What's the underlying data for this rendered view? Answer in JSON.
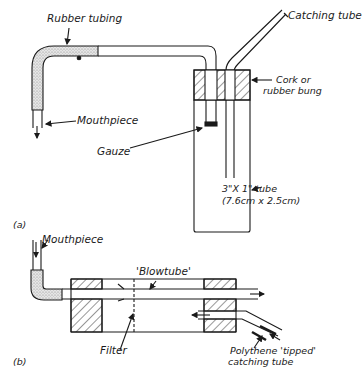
{
  "figure_a": {
    "panel_label": "(a)",
    "labels": {
      "rubber_tubing": "Rubber tubing",
      "catching_tube": "Catching tube",
      "cork_line1": "Cork or",
      "cork_line2": "rubber bung",
      "mouthpiece": "Mouthpiece",
      "gauze": "Gauze",
      "tube_size_line1": "3\"X 1\" tube",
      "tube_size_line2": "(7.6cm x 2.5cm)"
    }
  },
  "figure_b": {
    "panel_label": "(b)",
    "labels": {
      "mouthpiece": "Mouthpiece",
      "blowtube": "'Blowtube'",
      "filter": "Filter",
      "catching_line1": "Polythene 'tipped'",
      "catching_line2": "catching tube"
    }
  },
  "colors": {
    "ink": "#1a1a1a",
    "stipple": "#c8c8c8",
    "background": "#ffffff"
  }
}
